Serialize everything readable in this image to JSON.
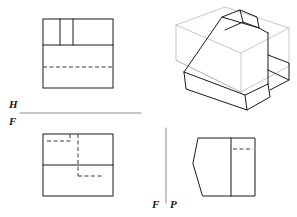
{
  "sheet": {
    "width": 297,
    "height": 217,
    "background": "#ffffff",
    "title": "Orthographic multiview projection with isometric pictorial"
  },
  "style": {
    "visible_line_color": "#1a1a1a",
    "visible_line_width": 1.0,
    "hidden_line_color": "#3a3a3a",
    "hidden_line_width": 1.0,
    "hidden_dash": "4,2.5",
    "construction_line_color": "#b9b9bd",
    "construction_line_width": 0.8,
    "fold_line_color": "#8d8d93",
    "fold_line_width": 1.0
  },
  "fold_lines": {
    "horizontal": {
      "name": "H/F fold line",
      "x1": 20,
      "y1": 113,
      "x2": 141,
      "y2": 113,
      "upper_label": "H",
      "lower_label": "F"
    },
    "vertical": {
      "name": "F/P fold line",
      "x1": 166,
      "y1": 128,
      "x2": 166,
      "y2": 203,
      "left_label": "F",
      "right_label": "P"
    }
  },
  "views": {
    "top": {
      "name": "Top view (horizontal projection)",
      "box": {
        "x": 43,
        "y": 19,
        "w": 70,
        "h": 69
      },
      "visible_lines": [
        [
          43,
          19,
          113,
          19
        ],
        [
          43,
          19,
          43,
          88
        ],
        [
          113,
          19,
          113,
          88
        ],
        [
          43,
          88,
          113,
          88
        ],
        [
          43,
          45,
          113,
          45
        ],
        [
          60,
          19,
          60,
          45
        ],
        [
          73,
          19,
          73,
          45
        ]
      ],
      "hidden_lines": [
        [
          43,
          67,
          113,
          67
        ]
      ]
    },
    "front": {
      "name": "Front view (frontal projection)",
      "box": {
        "x": 43,
        "y": 134,
        "w": 70,
        "h": 62
      },
      "visible_lines": [
        [
          43,
          134,
          113,
          134
        ],
        [
          43,
          134,
          43,
          196
        ],
        [
          113,
          134,
          113,
          196
        ],
        [
          43,
          196,
          113,
          196
        ],
        [
          43,
          165,
          113,
          165
        ]
      ],
      "hidden_lines": [
        [
          47,
          141,
          70,
          141
        ],
        [
          70,
          134,
          70,
          141
        ],
        [
          78,
          134,
          78,
          165
        ],
        [
          78,
          165,
          78,
          176
        ],
        [
          78,
          176,
          104,
          176
        ]
      ]
    },
    "side": {
      "name": "Right side view (profile projection)",
      "visible_outline": [
        [
          193,
          163
        ],
        [
          198,
          138
        ],
        [
          231,
          138
        ],
        [
          231,
          196
        ],
        [
          203,
          196
        ]
      ],
      "visible_lines": [
        [
          231,
          138,
          255,
          138
        ],
        [
          255,
          138,
          255,
          196
        ],
        [
          231,
          196,
          255,
          196
        ],
        [
          231,
          138,
          231,
          196
        ]
      ],
      "hidden_lines": [
        [
          233,
          149,
          253,
          149
        ]
      ]
    },
    "pictorial": {
      "name": "Isometric pictorial view",
      "construction_box": [
        [
          176,
          60
        ],
        [
          176,
          25
        ],
        [
          225,
          7
        ],
        [
          289,
          28
        ],
        [
          289,
          66
        ],
        [
          241,
          92
        ],
        [
          176,
          60
        ],
        [
          241,
          92
        ],
        [
          241,
          53
        ],
        [
          289,
          28
        ],
        [
          241,
          53
        ],
        [
          176,
          25
        ]
      ],
      "object_lines": [
        [
          184,
          72,
          222,
          17
        ],
        [
          222,
          17,
          259,
          28
        ],
        [
          259,
          28,
          268,
          33
        ],
        [
          184,
          72,
          245,
          95
        ],
        [
          245,
          95,
          268,
          84
        ],
        [
          268,
          33,
          268,
          84
        ],
        [
          184,
          72,
          186,
          89
        ],
        [
          186,
          89,
          247,
          110
        ],
        [
          247,
          110,
          270,
          97
        ],
        [
          247,
          110,
          245,
          95
        ],
        [
          270,
          97,
          268,
          84
        ],
        [
          186,
          89,
          184,
          72
        ],
        [
          222,
          17,
          240,
          10
        ],
        [
          240,
          10,
          257,
          17
        ],
        [
          257,
          17,
          259,
          28
        ],
        [
          240,
          10,
          243,
          22
        ],
        [
          243,
          22,
          259,
          28
        ],
        [
          243,
          22,
          225,
          30
        ],
        [
          268,
          55,
          289,
          63
        ],
        [
          289,
          63,
          289,
          80
        ],
        [
          289,
          80,
          270,
          90
        ],
        [
          268,
          70,
          289,
          80
        ],
        [
          268,
          55,
          268,
          84
        ]
      ]
    }
  }
}
